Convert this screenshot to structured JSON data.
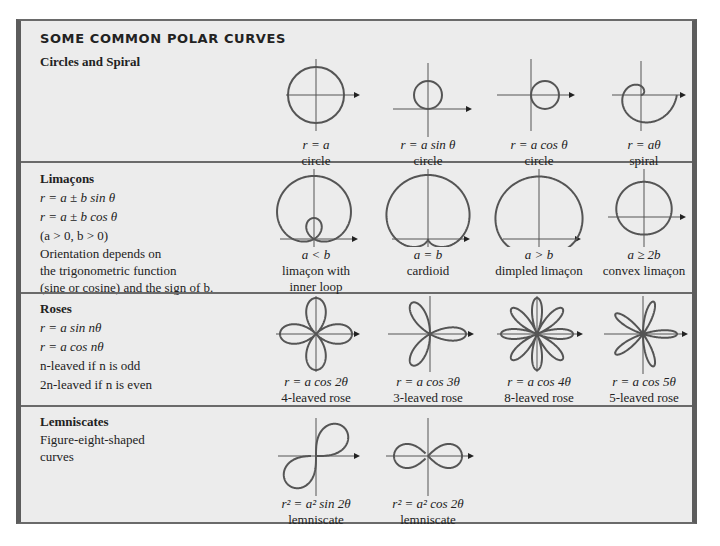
{
  "title": "SOME COMMON POLAR CURVES",
  "sections": [
    {
      "heading": "Circles and Spiral",
      "lines": [],
      "figures": [
        {
          "equation": "r = a",
          "name": "circle",
          "curve": "circle-origin"
        },
        {
          "equation": "r = a sin θ",
          "name": "circle",
          "curve": "circle-sin"
        },
        {
          "equation": "r = a cos θ",
          "name": "circle",
          "curve": "circle-cos"
        },
        {
          "equation": "r = aθ",
          "name": "spiral",
          "curve": "spiral"
        }
      ]
    },
    {
      "heading": "Limaçons",
      "lines": [
        "r = a ± b sin θ",
        "r = a ± b cos θ",
        "(a > 0, b > 0)"
      ],
      "note": [
        "Orientation depends on",
        "the trigonometric function",
        "(sine or cosine) and the sign of b."
      ],
      "figures": [
        {
          "equation": "a < b",
          "name": "limaçon with",
          "name2": "inner loop",
          "curve": "limacon-inner-loop"
        },
        {
          "equation": "a = b",
          "name": "cardioid",
          "curve": "cardioid"
        },
        {
          "equation": "a > b",
          "name": "dimpled limaçon",
          "curve": "dimpled-limacon"
        },
        {
          "equation": "a ≥ 2b",
          "name": "convex limaçon",
          "curve": "convex-limacon"
        }
      ]
    },
    {
      "heading": "Roses",
      "lines": [
        "r = a sin nθ",
        "r = a cos nθ",
        "n-leaved if n is odd",
        "2n-leaved if n is even"
      ],
      "figures": [
        {
          "equation": "r = a cos 2θ",
          "name": "4-leaved rose",
          "curve": "rose-2"
        },
        {
          "equation": "r = a cos 3θ",
          "name": "3-leaved rose",
          "curve": "rose-3"
        },
        {
          "equation": "r = a cos 4θ",
          "name": "8-leaved rose",
          "curve": "rose-4"
        },
        {
          "equation": "r = a cos 5θ",
          "name": "5-leaved rose",
          "curve": "rose-5"
        }
      ]
    },
    {
      "heading": "Lemniscates",
      "lines": [
        "Figure-eight-shaped",
        "curves"
      ],
      "figures": [
        {
          "equation": "r² = a² sin 2θ",
          "name": "lemniscate",
          "curve": "lemniscate-sin"
        },
        {
          "equation": "r² = a² cos 2θ",
          "name": "lemniscate",
          "curve": "lemniscate-cos"
        }
      ]
    }
  ],
  "colors": {
    "background": "#ececec",
    "border": "#5c5c5c",
    "curve": "#555555",
    "text": "#222222"
  }
}
